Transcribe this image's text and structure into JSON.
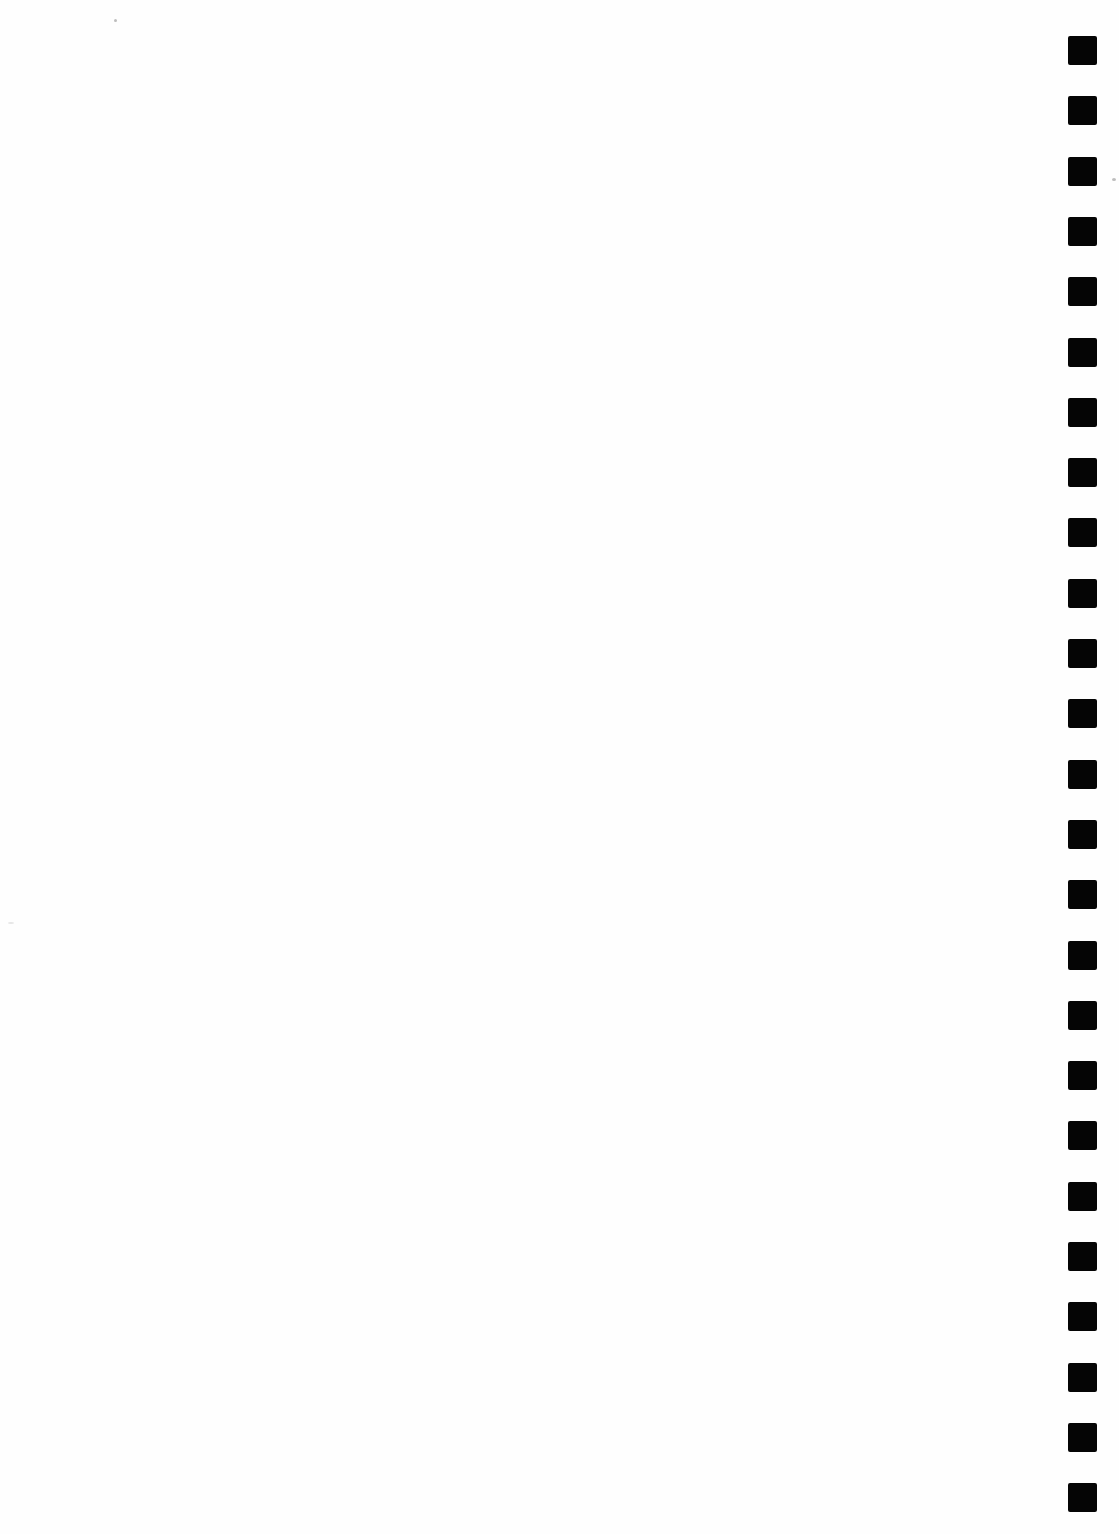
{
  "document": {
    "type": "blank scanned page",
    "background_color": "#ffffff",
    "binding": {
      "side": "right",
      "hole_count": 25,
      "hole_color": "#050505",
      "hole_size_px": 29,
      "first_hole_top_px": 36,
      "hole_spacing_px": 60.3
    }
  }
}
